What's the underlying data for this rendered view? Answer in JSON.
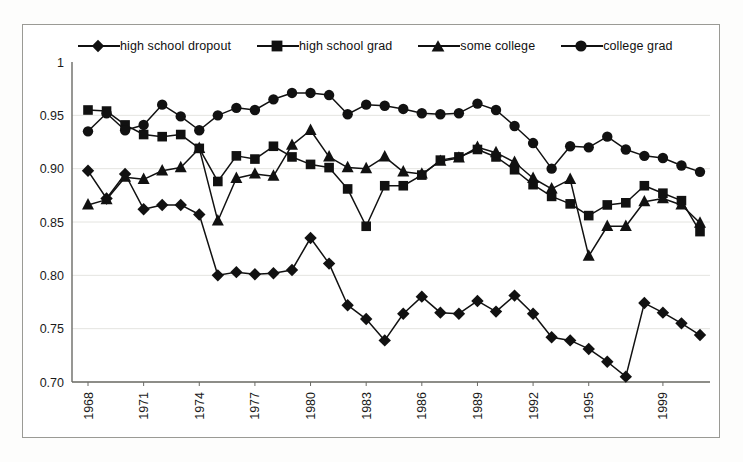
{
  "chart_data": {
    "type": "line",
    "title": "",
    "subtitle": "",
    "xlabel": "",
    "ylabel": "",
    "xlim": [
      1968,
      2001
    ],
    "ylim": [
      0.7,
      1.0
    ],
    "grid": true,
    "grid_axis": "y",
    "legend_position": "top",
    "y_ticks": [
      "1",
      "0.95",
      "0.90",
      "0.85",
      "0.80",
      "0.75",
      "0.70"
    ],
    "y_tick_values": [
      1.0,
      0.95,
      0.9,
      0.85,
      0.8,
      0.75,
      0.7
    ],
    "x_ticks": [
      "1968",
      "1971",
      "1974",
      "1977",
      "1980",
      "1983",
      "1986",
      "1989",
      "1992",
      "1995",
      "1999"
    ],
    "x_tick_values": [
      1968,
      1971,
      1974,
      1977,
      1980,
      1983,
      1986,
      1989,
      1992,
      1995,
      1999
    ],
    "x": [
      1968,
      1969,
      1970,
      1971,
      1972,
      1973,
      1974,
      1975,
      1976,
      1977,
      1978,
      1979,
      1980,
      1981,
      1982,
      1983,
      1984,
      1985,
      1986,
      1987,
      1988,
      1989,
      1990,
      1991,
      1992,
      1993,
      1994,
      1995,
      1996,
      1997,
      1998,
      1999,
      2000,
      2001
    ],
    "series": [
      {
        "name": "high school dropout",
        "marker": "diamond",
        "values": [
          0.898,
          0.872,
          0.895,
          0.862,
          0.866,
          0.866,
          0.857,
          0.8,
          0.803,
          0.801,
          0.802,
          0.805,
          0.835,
          0.811,
          0.772,
          0.759,
          0.739,
          0.764,
          0.78,
          0.765,
          0.764,
          0.776,
          0.766,
          0.781,
          0.764,
          0.742,
          0.739,
          0.731,
          0.719,
          0.705,
          0.774,
          0.765,
          0.755,
          0.744
        ]
      },
      {
        "name": "high school grad",
        "marker": "square",
        "values": [
          0.955,
          0.954,
          0.941,
          0.932,
          0.93,
          0.932,
          0.919,
          0.888,
          0.912,
          0.909,
          0.921,
          0.911,
          0.904,
          0.901,
          0.881,
          0.846,
          0.884,
          0.884,
          0.894,
          0.908,
          0.911,
          0.918,
          0.911,
          0.899,
          0.885,
          0.874,
          0.867,
          0.856,
          0.866,
          0.868,
          0.884,
          0.877,
          0.87,
          0.841
        ]
      },
      {
        "name": "some college",
        "marker": "triangle",
        "values": [
          0.866,
          0.871,
          0.892,
          0.89,
          0.898,
          0.901,
          0.919,
          0.851,
          0.891,
          0.895,
          0.893,
          0.922,
          0.936,
          0.911,
          0.901,
          0.9,
          0.911,
          0.897,
          0.895,
          0.907,
          0.91,
          0.92,
          0.915,
          0.906,
          0.891,
          0.881,
          0.89,
          0.818,
          0.846,
          0.846,
          0.869,
          0.872,
          0.866,
          0.849
        ]
      },
      {
        "name": "college grad",
        "marker": "circle",
        "values": [
          0.935,
          0.952,
          0.936,
          0.941,
          0.96,
          0.949,
          0.936,
          0.95,
          0.957,
          0.955,
          0.965,
          0.971,
          0.971,
          0.969,
          0.951,
          0.96,
          0.959,
          0.956,
          0.952,
          0.951,
          0.952,
          0.961,
          0.955,
          0.94,
          0.924,
          0.9,
          0.921,
          0.92,
          0.93,
          0.918,
          0.912,
          0.91,
          0.903,
          0.897
        ]
      }
    ]
  },
  "legend": {
    "items": [
      {
        "label": "high school dropout",
        "marker": "diamond"
      },
      {
        "label": "high school grad",
        "marker": "square"
      },
      {
        "label": "some college",
        "marker": "triangle"
      },
      {
        "label": "college grad",
        "marker": "circle"
      }
    ]
  },
  "style": {
    "line_color": "#111111",
    "marker_color": "#111111",
    "grid_color": "#e4e4e0",
    "axis_color": "#6b6b66",
    "frame_color": "#9a9a95",
    "background": "#ffffff"
  }
}
